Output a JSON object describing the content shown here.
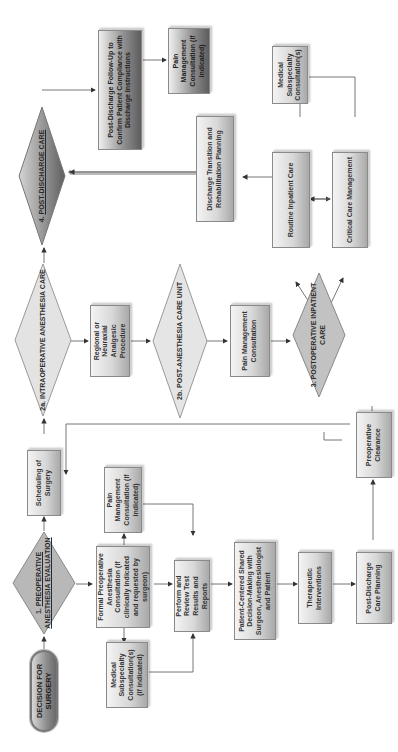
{
  "diagram": {
    "orientation": "rotated 90 degrees counter-clockwise",
    "start": {
      "label": "DECISION FOR SURGERY"
    },
    "phases": [
      {
        "id": "p1",
        "number": "1.",
        "label": "PREOPERATIVE ANESTHESIA EVALUATION"
      },
      {
        "id": "p2a",
        "number": "2a.",
        "label": "INTRAOPERATIVE ANESTHESIA CARE"
      },
      {
        "id": "p2b",
        "number": "2b.",
        "label": "POST-ANESTHESIA CARE UNIT"
      },
      {
        "id": "p3",
        "number": "3.",
        "label": "POSTOPERATIVE INPATIENT CARE"
      },
      {
        "id": "p4",
        "number": "4.",
        "label": "POST-DISCHARGE CARE"
      }
    ],
    "boxes": {
      "scheduling": "Scheduling of Surgery",
      "formal_consult": "Formal Preoperative Anesthesia Consultation (if clinically indicated and requested by surgeon)",
      "pain_mgmt_preop": "Pain Management Consultation (if indicated)",
      "medical_subspecialty_preop": "Medical Subspecialty Consultation(s) (if indicated)",
      "perform_review": "Perform and Review Test Results and Reports",
      "shared_decision": "Patient-Centered Shared Decision-Making with Surgeon, Anesthesiologist and Patient",
      "therapeutic": "Therapeutic Interventions",
      "post_discharge_planning": "Post-Discharge Care Planning",
      "preop_clearance": "Preoperative Clearance",
      "regional_procedure": "Regional or Neuraxial Analgesic Procedure",
      "pain_mgmt_pacu": "Pain Management Consultation",
      "routine_inpatient": "Routine Inpatient Care",
      "critical_care": "Critical Care Management",
      "medical_subspecialty_postop": "Medical Subspecialty Consultation(s)",
      "discharge_transition": "Discharge Transition and Rehabilitation Planning",
      "post_discharge_followup": "Post-Discharge Follow-Up to Confirm Patient Compliance with Discharge Instructions",
      "pain_mgmt_post_discharge": "Pain Management Consultation (if indicated)"
    }
  },
  "colors": {
    "box_light": "#f4f4f4",
    "box_mid": "#d8d8d8",
    "box_dark": "#a9a9a9",
    "phase4_dark": "#5d5d5d",
    "line": "#555555",
    "border": "#8a8a8a"
  }
}
